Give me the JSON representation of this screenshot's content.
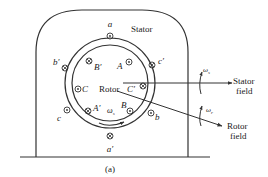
{
  "figure": {
    "caption": "(a)",
    "labels": {
      "stator": "Stator",
      "rotor": "Rotor",
      "stator_field": [
        "Stator",
        "field"
      ],
      "rotor_field": [
        "Rotor",
        "field"
      ],
      "omega_s": "ω",
      "omega_s_sub": "s",
      "omega_r": "ω",
      "omega_r_sub": "r",
      "omega_center": "ω",
      "omega_center_sub": "s"
    },
    "stator_conductors": [
      {
        "name": "a",
        "symbol": "dot"
      },
      {
        "name": "c′",
        "symbol": "cross"
      },
      {
        "name": "b",
        "symbol": "dot"
      },
      {
        "name": "a′",
        "symbol": "cross"
      },
      {
        "name": "c",
        "symbol": "dot"
      },
      {
        "name": "b′",
        "symbol": "cross"
      }
    ],
    "rotor_conductors": [
      {
        "name": "A",
        "symbol": "dot"
      },
      {
        "name": "C′",
        "symbol": "cross"
      },
      {
        "name": "B",
        "symbol": "dot"
      },
      {
        "name": "A′",
        "symbol": "cross"
      },
      {
        "name": "C",
        "symbol": "dot"
      },
      {
        "name": "B′",
        "symbol": "cross"
      }
    ],
    "colors": {
      "line": "#333333",
      "background": "#ffffff"
    }
  }
}
